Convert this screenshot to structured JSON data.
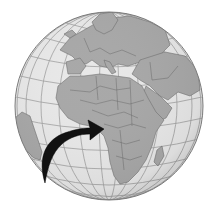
{
  "map": {
    "projection": "orthographic",
    "center_region": "Africa",
    "visible_regions": [
      "Europe",
      "Africa",
      "Middle East",
      "Arabian Peninsula",
      "South America (eastern tip)",
      "Madagascar",
      "Atlantic Ocean",
      "Indian Ocean",
      "Mediterranean Sea"
    ],
    "highlighted_region": "West Africa / Gulf of Guinea",
    "colors": {
      "background": "#ffffff",
      "ocean": "#e6e6e6",
      "land": "#a6a6a6",
      "borders": "#6e6e6e",
      "graticule": "#9a9a9a",
      "globe_outline": "#7a7a7a",
      "arrow": "#111111"
    }
  },
  "annotations": {
    "arrow": {
      "direction": "pointing-right-up",
      "target": "Gulf of Guinea coast"
    }
  }
}
